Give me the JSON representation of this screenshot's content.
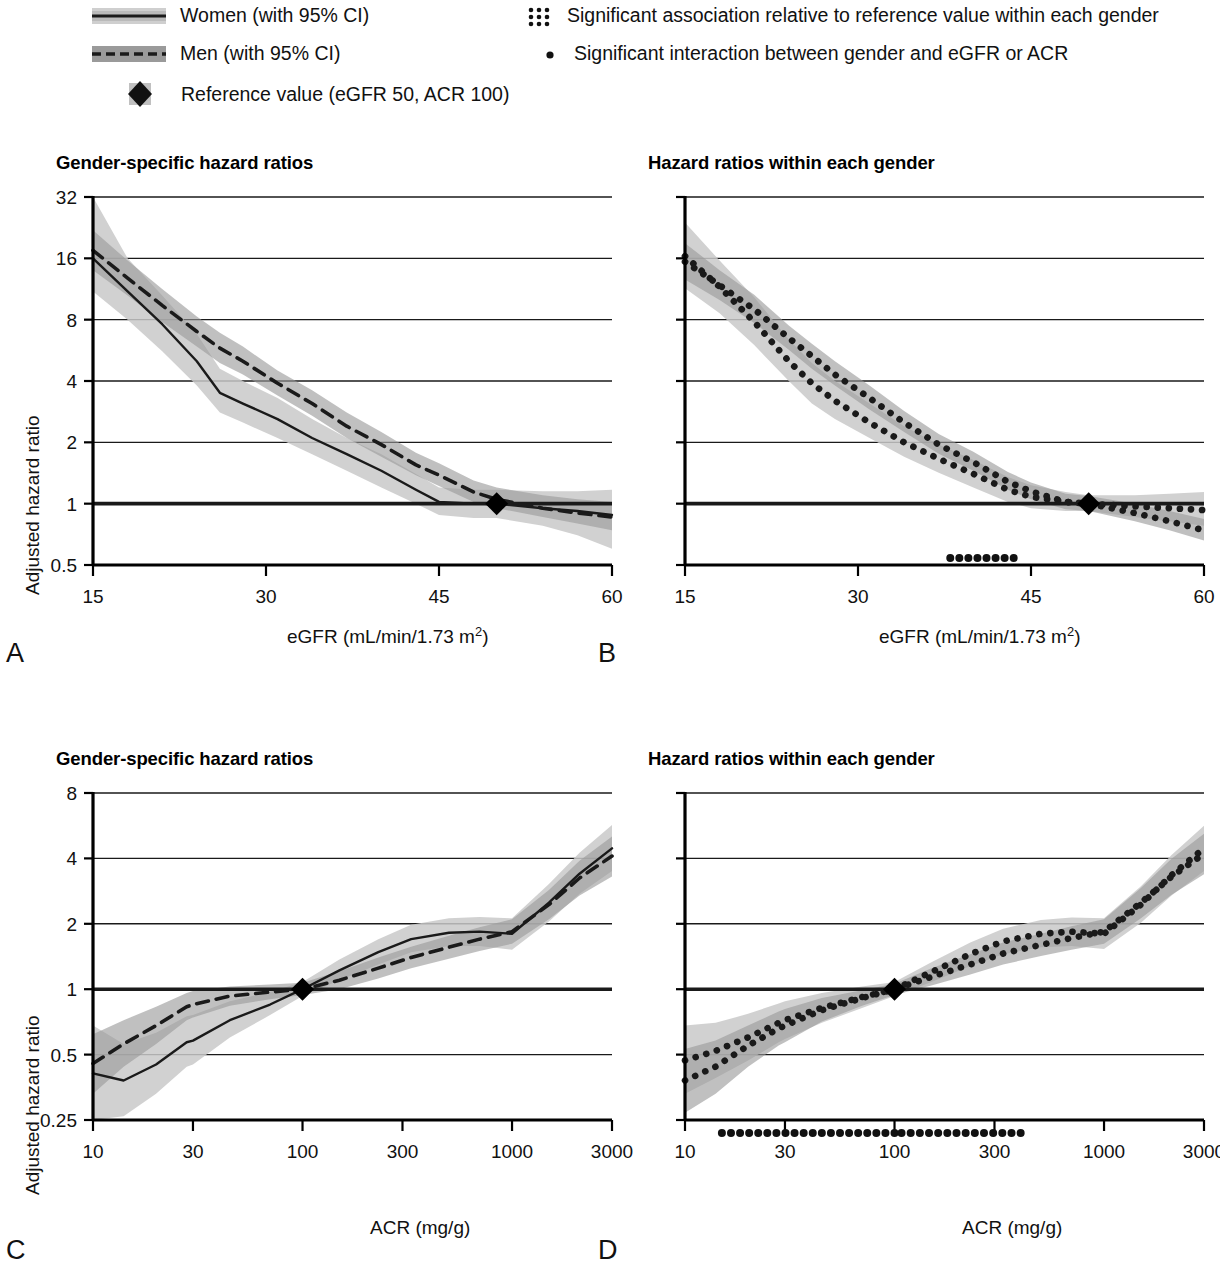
{
  "legend": {
    "items": [
      {
        "id": "women",
        "marker": "solid-line-with-band",
        "label": "Women (with 95% CI)"
      },
      {
        "id": "men",
        "marker": "dashed-line-with-band",
        "label": "Men (with 95% CI)"
      },
      {
        "id": "reference",
        "marker": "black-diamond",
        "label": "Reference value (eGFR 50, ACR 100)"
      },
      {
        "id": "sig-association",
        "marker": "dotted-block",
        "label": "Significant association relative to reference value within each gender"
      },
      {
        "id": "sig-interaction",
        "marker": "single-dot",
        "label": "Significant interaction between gender and eGFR or ACR"
      }
    ]
  },
  "colors": {
    "line": "#1a1a1a",
    "ci_women": "#c9c9c9",
    "ci_men": "#9a9a9a",
    "grid": "#1a1a1a",
    "axis": "#000000",
    "reference_marker": "#000000"
  },
  "panels": [
    {
      "letter": "A",
      "title": "Gender-specific hazard ratios",
      "xlabel_html": "eGFR (mL/min/1.73 m<sup>2</sup>)",
      "xlabel": "eGFR (mL/min/1.73 m2)",
      "ylabel": "Adjusted hazard ratio",
      "style": "lines"
    },
    {
      "letter": "B",
      "title": "Hazard ratios within each gender",
      "xlabel_html": "eGFR (mL/min/1.73 m<sup>2</sup>)",
      "xlabel": "eGFR (mL/min/1.73 m2)",
      "ylabel": "",
      "style": "dotted"
    },
    {
      "letter": "C",
      "title": "Gender-specific hazard ratios",
      "xlabel_html": "ACR (mg/g)",
      "xlabel": "ACR (mg/g)",
      "ylabel": "Adjusted hazard ratio",
      "style": "lines"
    },
    {
      "letter": "D",
      "title": "Hazard ratios within each gender",
      "xlabel_html": "ACR (mg/g)",
      "xlabel": "ACR (mg/g)",
      "ylabel": "",
      "style": "dotted"
    }
  ],
  "chart_data": [
    {
      "panel": "A",
      "type": "line",
      "title": "Gender-specific hazard ratios",
      "xlabel": "eGFR (mL/min/1.73 m2)",
      "ylabel": "Adjusted hazard ratio",
      "xscale": "linear",
      "yscale": "log2",
      "xlim": [
        15,
        60
      ],
      "ylim": [
        0.5,
        32
      ],
      "xticks": [
        15,
        30,
        45,
        60
      ],
      "yticks": [
        0.5,
        1,
        2,
        4,
        8,
        16,
        32
      ],
      "grid": "horizontal",
      "legend_position": "above-figure",
      "reference": {
        "x": 50,
        "y": 1,
        "label": "Reference value (eGFR 50, ACR 100)"
      },
      "x": [
        15,
        18,
        21,
        24,
        26,
        28,
        31,
        34,
        37,
        40,
        43,
        45,
        48,
        50,
        54,
        57,
        60
      ],
      "series": [
        {
          "name": "Women (with 95% CI)",
          "style": "solid",
          "values": [
            16.0,
            11.0,
            7.6,
            5.0,
            3.5,
            3.1,
            2.6,
            2.1,
            1.75,
            1.45,
            1.17,
            1.02,
            1.0,
            1.0,
            0.95,
            0.92,
            0.88
          ],
          "ci_lower": [
            11.0,
            8.0,
            5.6,
            3.8,
            2.8,
            2.5,
            2.1,
            1.75,
            1.45,
            1.2,
            1.0,
            0.88,
            0.85,
            0.85,
            0.78,
            0.7,
            0.6
          ],
          "ci_upper": [
            32.0,
            16.0,
            10.5,
            6.8,
            4.6,
            4.0,
            3.3,
            2.6,
            2.1,
            1.75,
            1.4,
            1.2,
            1.17,
            1.17,
            1.15,
            1.15,
            1.17
          ]
        },
        {
          "name": "Men (with 95% CI)",
          "style": "dashed",
          "values": [
            17.5,
            12.8,
            9.4,
            7.0,
            5.8,
            5.0,
            3.9,
            3.1,
            2.4,
            1.95,
            1.55,
            1.38,
            1.14,
            1.05,
            0.95,
            0.9,
            0.86
          ],
          "ci_lower": [
            14.0,
            10.5,
            7.8,
            5.9,
            4.9,
            4.3,
            3.4,
            2.7,
            2.1,
            1.7,
            1.38,
            1.22,
            1.02,
            0.95,
            0.86,
            0.8,
            0.74
          ],
          "ci_upper": [
            22.0,
            15.6,
            11.3,
            8.3,
            6.9,
            5.9,
            4.5,
            3.6,
            2.8,
            2.25,
            1.78,
            1.58,
            1.3,
            1.2,
            1.1,
            1.05,
            1.02
          ]
        }
      ]
    },
    {
      "panel": "B",
      "type": "line",
      "title": "Hazard ratios within each gender",
      "xlabel": "eGFR (mL/min/1.73 m2)",
      "ylabel": "Adjusted hazard ratio",
      "xscale": "linear",
      "yscale": "log2",
      "xlim": [
        15,
        60
      ],
      "ylim": [
        0.5,
        32
      ],
      "xticks": [
        15,
        30,
        45,
        60
      ],
      "yticks": [
        0.5,
        1,
        2,
        4,
        8,
        16,
        32
      ],
      "grid": "horizontal",
      "reference": {
        "x": 50,
        "y": 1,
        "label": "Reference value (eGFR 50, ACR 100)"
      },
      "significant_interaction_x_ranges": [
        [
          38.0,
          43.5
        ]
      ],
      "x": [
        15,
        18,
        21,
        24,
        26,
        28,
        31,
        34,
        37,
        40,
        43,
        45,
        48,
        50,
        54,
        57,
        60
      ],
      "series": [
        {
          "name": "Women (with 95% CI)",
          "style": "dotted",
          "significant": true,
          "values": [
            16.4,
            11.6,
            7.8,
            5.0,
            3.9,
            3.2,
            2.5,
            2.0,
            1.66,
            1.4,
            1.17,
            1.08,
            1.02,
            1.0,
            0.97,
            0.95,
            0.93
          ],
          "ci_lower": [
            11.4,
            8.6,
            6.0,
            4.0,
            3.1,
            2.6,
            2.1,
            1.7,
            1.42,
            1.2,
            1.02,
            0.95,
            0.92,
            0.92,
            0.86,
            0.82,
            0.78
          ],
          "ci_upper": [
            24.0,
            15.6,
            10.3,
            6.4,
            4.9,
            4.0,
            3.1,
            2.4,
            1.95,
            1.64,
            1.35,
            1.23,
            1.14,
            1.1,
            1.1,
            1.12,
            1.14
          ]
        },
        {
          "name": "Men (with 95% CI)",
          "style": "dotted",
          "significant": true,
          "values": [
            15.4,
            11.8,
            9.0,
            6.5,
            5.3,
            4.3,
            3.3,
            2.5,
            1.95,
            1.6,
            1.28,
            1.15,
            1.02,
            1.0,
            0.9,
            0.82,
            0.74
          ],
          "ci_lower": [
            12.6,
            10.0,
            7.7,
            5.7,
            4.6,
            3.8,
            2.9,
            2.25,
            1.76,
            1.45,
            1.17,
            1.05,
            0.94,
            0.92,
            0.82,
            0.74,
            0.66
          ],
          "ci_upper": [
            19.0,
            14.0,
            10.6,
            7.5,
            6.1,
            5.0,
            3.8,
            2.85,
            2.2,
            1.8,
            1.43,
            1.27,
            1.12,
            1.09,
            1.0,
            0.92,
            0.84
          ]
        }
      ]
    },
    {
      "panel": "C",
      "type": "line",
      "title": "Gender-specific hazard ratios",
      "xlabel": "ACR (mg/g)",
      "ylabel": "Adjusted hazard ratio",
      "xscale": "log10",
      "yscale": "log2",
      "xlim": [
        10,
        3000
      ],
      "ylim": [
        0.25,
        8
      ],
      "xticks": [
        10,
        30,
        100,
        300,
        1000,
        3000
      ],
      "yticks": [
        0.25,
        0.5,
        1,
        2,
        4,
        8
      ],
      "grid": "horizontal",
      "reference": {
        "x": 100,
        "y": 1,
        "label": "Reference value (eGFR 50, ACR 100)"
      },
      "x": [
        10,
        14,
        20,
        28,
        30,
        45,
        70,
        100,
        150,
        230,
        330,
        500,
        700,
        1000,
        1500,
        2100,
        3000
      ],
      "series": [
        {
          "name": "Women (with 95% CI)",
          "style": "solid",
          "values": [
            0.41,
            0.38,
            0.45,
            0.57,
            0.58,
            0.72,
            0.85,
            1.0,
            1.22,
            1.48,
            1.7,
            1.82,
            1.84,
            1.8,
            2.5,
            3.4,
            4.45
          ],
          "ci_lower": [
            0.25,
            0.26,
            0.33,
            0.44,
            0.45,
            0.6,
            0.76,
            0.93,
            1.1,
            1.3,
            1.48,
            1.58,
            1.58,
            1.52,
            2.05,
            2.75,
            3.5
          ],
          "ci_upper": [
            0.68,
            0.56,
            0.63,
            0.75,
            0.76,
            0.88,
            0.97,
            1.08,
            1.37,
            1.7,
            1.98,
            2.12,
            2.15,
            2.12,
            3.05,
            4.25,
            5.7
          ]
        },
        {
          "name": "Men (with 95% CI)",
          "style": "dashed",
          "values": [
            0.455,
            0.56,
            0.68,
            0.83,
            0.85,
            0.93,
            0.97,
            1.0,
            1.1,
            1.25,
            1.4,
            1.56,
            1.7,
            1.84,
            2.45,
            3.25,
            4.1
          ],
          "ci_lower": [
            0.33,
            0.44,
            0.56,
            0.72,
            0.74,
            0.84,
            0.9,
            0.94,
            1.0,
            1.12,
            1.25,
            1.38,
            1.5,
            1.62,
            2.1,
            2.7,
            3.3
          ],
          "ci_upper": [
            0.62,
            0.72,
            0.83,
            0.96,
            0.98,
            1.03,
            1.05,
            1.07,
            1.21,
            1.4,
            1.57,
            1.76,
            1.93,
            2.1,
            2.86,
            3.9,
            5.05
          ]
        }
      ]
    },
    {
      "panel": "D",
      "type": "line",
      "title": "Hazard ratios within each gender",
      "xlabel": "ACR (mg/g)",
      "ylabel": "Adjusted hazard ratio",
      "xscale": "log10",
      "yscale": "log2",
      "xlim": [
        10,
        3000
      ],
      "ylim": [
        0.25,
        8
      ],
      "xticks": [
        10,
        30,
        100,
        300,
        1000,
        3000
      ],
      "yticks": [
        0.25,
        0.5,
        1,
        2,
        4,
        8
      ],
      "grid": "horizontal",
      "reference": {
        "x": 100,
        "y": 1,
        "label": "Reference value (eGFR 50, ACR 100)"
      },
      "significant_interaction_x_ranges": [
        [
          15,
          100
        ],
        [
          108,
          400
        ]
      ],
      "x": [
        10,
        14,
        20,
        28,
        30,
        45,
        70,
        100,
        150,
        230,
        330,
        500,
        700,
        1000,
        1500,
        2100,
        3000
      ],
      "series": [
        {
          "name": "Women (with 95% CI)",
          "style": "dotted",
          "significant": true,
          "values": [
            0.47,
            0.52,
            0.6,
            0.7,
            0.72,
            0.82,
            0.92,
            1.0,
            1.2,
            1.45,
            1.66,
            1.8,
            1.84,
            1.8,
            2.45,
            3.35,
            4.45
          ],
          "ci_lower": [
            0.33,
            0.39,
            0.47,
            0.57,
            0.59,
            0.7,
            0.82,
            0.93,
            1.08,
            1.28,
            1.45,
            1.56,
            1.58,
            1.53,
            2.02,
            2.7,
            3.5
          ],
          "ci_upper": [
            0.68,
            0.7,
            0.77,
            0.86,
            0.88,
            0.96,
            1.03,
            1.08,
            1.33,
            1.64,
            1.9,
            2.08,
            2.14,
            2.12,
            2.98,
            4.15,
            5.65
          ]
        },
        {
          "name": "Men (with 95% CI)",
          "style": "dotted",
          "significant": true,
          "values": [
            0.38,
            0.44,
            0.55,
            0.66,
            0.68,
            0.8,
            0.91,
            1.0,
            1.14,
            1.3,
            1.46,
            1.6,
            1.72,
            1.84,
            2.5,
            3.3,
            4.2
          ],
          "ci_lower": [
            0.27,
            0.33,
            0.44,
            0.55,
            0.57,
            0.71,
            0.84,
            0.94,
            1.04,
            1.17,
            1.3,
            1.42,
            1.52,
            1.62,
            2.12,
            2.72,
            3.38
          ],
          "ci_upper": [
            0.53,
            0.58,
            0.68,
            0.79,
            0.81,
            0.91,
            0.99,
            1.06,
            1.25,
            1.45,
            1.64,
            1.8,
            1.95,
            2.1,
            2.92,
            3.98,
            5.2
          ]
        }
      ]
    }
  ]
}
